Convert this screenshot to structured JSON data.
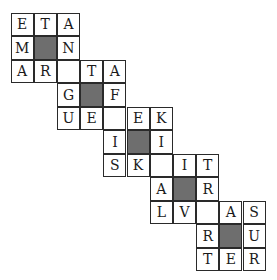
{
  "puzzle": {
    "type": "crossword-grid",
    "rows": 11,
    "cols": 11,
    "colors": {
      "cell_bg": "#ffffff",
      "block_bg": "#6e6e6e",
      "border": "#2a2a2a",
      "text": "#1a1a1a"
    },
    "cells": [
      {
        "r": 0,
        "c": 0,
        "v": "E"
      },
      {
        "r": 0,
        "c": 1,
        "v": "T"
      },
      {
        "r": 0,
        "c": 2,
        "v": "A"
      },
      {
        "r": 1,
        "c": 0,
        "v": "M"
      },
      {
        "r": 1,
        "c": 1,
        "v": "#"
      },
      {
        "r": 1,
        "c": 2,
        "v": "N"
      },
      {
        "r": 2,
        "c": 0,
        "v": "A"
      },
      {
        "r": 2,
        "c": 1,
        "v": "R"
      },
      {
        "r": 2,
        "c": 2,
        "v": ""
      },
      {
        "r": 2,
        "c": 3,
        "v": "T"
      },
      {
        "r": 2,
        "c": 4,
        "v": "A"
      },
      {
        "r": 3,
        "c": 2,
        "v": "G"
      },
      {
        "r": 3,
        "c": 3,
        "v": "#"
      },
      {
        "r": 3,
        "c": 4,
        "v": "F"
      },
      {
        "r": 4,
        "c": 2,
        "v": "U"
      },
      {
        "r": 4,
        "c": 3,
        "v": "E"
      },
      {
        "r": 4,
        "c": 4,
        "v": ""
      },
      {
        "r": 4,
        "c": 5,
        "v": "E"
      },
      {
        "r": 4,
        "c": 6,
        "v": "K"
      },
      {
        "r": 5,
        "c": 4,
        "v": "I"
      },
      {
        "r": 5,
        "c": 5,
        "v": "#"
      },
      {
        "r": 5,
        "c": 6,
        "v": "I"
      },
      {
        "r": 6,
        "c": 4,
        "v": "S"
      },
      {
        "r": 6,
        "c": 5,
        "v": "K"
      },
      {
        "r": 6,
        "c": 6,
        "v": ""
      },
      {
        "r": 6,
        "c": 7,
        "v": "I"
      },
      {
        "r": 6,
        "c": 8,
        "v": "T"
      },
      {
        "r": 7,
        "c": 6,
        "v": "A"
      },
      {
        "r": 7,
        "c": 7,
        "v": "#"
      },
      {
        "r": 7,
        "c": 8,
        "v": "R"
      },
      {
        "r": 8,
        "c": 6,
        "v": "L"
      },
      {
        "r": 8,
        "c": 7,
        "v": "V"
      },
      {
        "r": 8,
        "c": 8,
        "v": ""
      },
      {
        "r": 8,
        "c": 9,
        "v": "A"
      },
      {
        "r": 8,
        "c": 10,
        "v": "S"
      },
      {
        "r": 9,
        "c": 8,
        "v": "R"
      },
      {
        "r": 9,
        "c": 9,
        "v": "#"
      },
      {
        "r": 9,
        "c": 10,
        "v": "U"
      },
      {
        "r": 10,
        "c": 8,
        "v": "T"
      },
      {
        "r": 10,
        "c": 9,
        "v": "E"
      },
      {
        "r": 10,
        "c": 10,
        "v": "R"
      }
    ]
  }
}
